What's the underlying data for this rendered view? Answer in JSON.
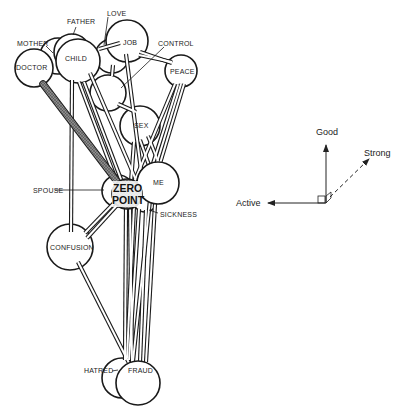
{
  "diagram": {
    "type": "semantic-space-node-diagram",
    "nodes": [
      {
        "id": "doctor",
        "label": "DOCTOR",
        "cx": 34,
        "cy": 68,
        "r": 19
      },
      {
        "id": "mother",
        "label": "MOTHER",
        "cx": 58,
        "cy": 56,
        "r": 18
      },
      {
        "id": "father",
        "label": "FATHER",
        "cx": 72,
        "cy": 52,
        "r": 18
      },
      {
        "id": "child",
        "label": "CHILD",
        "cx": 78,
        "cy": 61,
        "r": 22
      },
      {
        "id": "love",
        "label": "LOVE",
        "cx": 112,
        "cy": 56,
        "r": 17
      },
      {
        "id": "job",
        "label": "JOB",
        "cx": 127,
        "cy": 41,
        "r": 21
      },
      {
        "id": "peace",
        "label": "PEACE",
        "cx": 181,
        "cy": 71,
        "r": 16
      },
      {
        "id": "control",
        "label": "CONTROL",
        "cx": 108,
        "cy": 93,
        "r": 18
      },
      {
        "id": "sex",
        "label": "SEX",
        "cx": 140,
        "cy": 126,
        "r": 20
      },
      {
        "id": "spouse",
        "label": "SPOUSE",
        "cx": 118,
        "cy": 191,
        "r": 16
      },
      {
        "id": "sickness",
        "label": "SICKNESS",
        "cx": 144,
        "cy": 201,
        "r": 12
      },
      {
        "id": "me",
        "label": "ME",
        "cx": 158,
        "cy": 183,
        "r": 21
      },
      {
        "id": "zero",
        "label": "ZERO POINT",
        "label_line1": "ZERO",
        "label_line2": "POINT",
        "cx": 126,
        "cy": 194,
        "r": 15
      },
      {
        "id": "confusion",
        "label": "CONFUSION",
        "cx": 70,
        "cy": 247,
        "r": 23
      },
      {
        "id": "hatred",
        "label": "HATRED",
        "cx": 122,
        "cy": 378,
        "r": 20
      },
      {
        "id": "fraud",
        "label": "FRAUD",
        "cx": 138,
        "cy": 383,
        "r": 22
      }
    ],
    "labels": {
      "mother": "MOTHER",
      "father": "FATHER",
      "love": "LOVE",
      "control": "CONTROL",
      "doctor": "DOCTOR",
      "child": "CHILD",
      "job": "JOB",
      "peace": "PEACE",
      "sex": "SEX",
      "me": "ME",
      "spouse": "SPOUSE",
      "zero_line1": "ZERO",
      "zero_line2": "POINT",
      "sickness": "SICKNESS",
      "confusion": "CONFUSION",
      "hatred": "HATRED",
      "fraud": "FRAUD"
    },
    "axes": {
      "good": "Good",
      "strong": "Strong",
      "active": "Active"
    },
    "colors": {
      "stroke": "#1a1a1a",
      "fill": "#ffffff",
      "zero_fill": "#6f6f6f",
      "doctor_rod": "#7a7a7a"
    }
  }
}
